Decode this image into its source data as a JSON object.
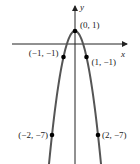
{
  "chart_data": {
    "type": "line",
    "title": "",
    "xlabel": "x",
    "ylabel": "y",
    "function": "y = 1 - 2x^2",
    "grid": false,
    "xlim": [
      -3,
      3.3
    ],
    "ylim": [
      -8.6,
      2.4
    ],
    "points": [
      {
        "x": 0,
        "y": 1,
        "label": "(0, 1)"
      },
      {
        "x": -1,
        "y": -1,
        "label": "(−1, −1)"
      },
      {
        "x": 1,
        "y": -1,
        "label": "(1, −1)"
      },
      {
        "x": -2,
        "y": -7,
        "label": "(−2, −7)"
      },
      {
        "x": 2,
        "y": -7,
        "label": "(2, −7)"
      }
    ],
    "colors": {
      "curve": "#555555",
      "axis": "#222222",
      "points": "#000000"
    }
  }
}
